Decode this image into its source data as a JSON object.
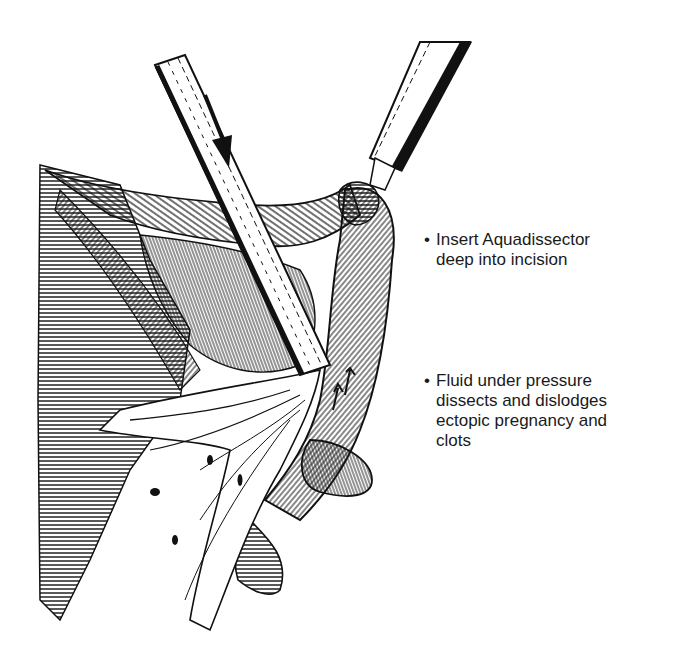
{
  "figure": {
    "colors": {
      "ink": "#111111",
      "paper": "#ffffff",
      "text": "#1a1a1a"
    }
  },
  "annotations": [
    {
      "bullet": "•",
      "text": "Insert Aquadissector\ndeep into incision"
    },
    {
      "bullet": "•",
      "text": "Fluid under pressure\ndissects and dislodges\nectopic pregnancy and\nclots"
    }
  ],
  "elements": {
    "suction_irrigation_tube": "diagonal tube with downward flow arrow",
    "grasping_instrument": "instrument holding fallopian tube at upper right",
    "fallopian_tube": "curved tube with upward arrows",
    "fluid_jet": "fluid spray dislodging tissue",
    "tissue": "hatched pelvic tissue and incision"
  }
}
